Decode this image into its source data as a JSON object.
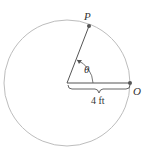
{
  "diagram": {
    "type": "circle-with-angle",
    "circle": {
      "cx": 67,
      "cy": 83,
      "r": 63,
      "stroke": "#bdbdbd"
    },
    "points": {
      "P": {
        "label": "P",
        "x": 89,
        "y": 26
      },
      "O": {
        "label": "O",
        "x": 130,
        "y": 83
      }
    },
    "angle_label": "θ",
    "radius_label": "4 ft",
    "colors": {
      "radius_line": "#555555",
      "point": "#555555",
      "text": "#333333"
    }
  }
}
